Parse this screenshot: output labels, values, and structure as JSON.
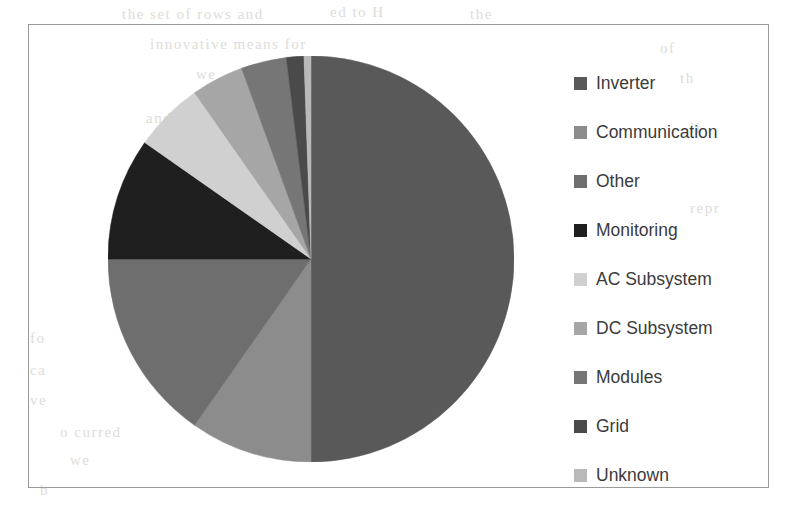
{
  "figure": {
    "frame_border_color": "#9a9a9a",
    "background_color": "#ffffff"
  },
  "legend": {
    "position": "right",
    "entries": [
      {
        "label": "Inverter",
        "color": "#595959"
      },
      {
        "label": "Communication",
        "color": "#8c8c8c"
      },
      {
        "label": "Other",
        "color": "#6e6e6e"
      },
      {
        "label": "Monitoring",
        "color": "#1f1f1f"
      },
      {
        "label": "AC Subsystem",
        "color": "#d0d0d0"
      },
      {
        "label": "DC Subsystem",
        "color": "#a6a6a6"
      },
      {
        "label": "Modules",
        "color": "#767676"
      },
      {
        "label": "Grid",
        "color": "#4a4a4a"
      },
      {
        "label": "Unknown",
        "color": "#b9b9b9"
      }
    ]
  },
  "bleed_through_text": [
    {
      "text": "the set of rows and",
      "x": 122,
      "y": 6
    },
    {
      "text": "ed to  H",
      "x": 330,
      "y": 4
    },
    {
      "text": "the",
      "x": 470,
      "y": 6
    },
    {
      "text": "innovative means for",
      "x": 150,
      "y": 36
    },
    {
      "text": "of",
      "x": 660,
      "y": 40
    },
    {
      "text": "we",
      "x": 196,
      "y": 66
    },
    {
      "text": "th",
      "x": 680,
      "y": 70
    },
    {
      "text": "and",
      "x": 146,
      "y": 110
    },
    {
      "text": "li",
      "x": 690,
      "y": 120
    },
    {
      "text": "repr",
      "x": 690,
      "y": 200
    },
    {
      "text": "ve repr",
      "x": 152,
      "y": 302
    },
    {
      "text": "fo",
      "x": 30,
      "y": 330
    },
    {
      "text": "ca",
      "x": 30,
      "y": 362
    },
    {
      "text": "ve",
      "x": 30,
      "y": 392
    },
    {
      "text": "o  curred",
      "x": 60,
      "y": 424
    },
    {
      "text": "we",
      "x": 70,
      "y": 452
    },
    {
      "text": "b",
      "x": 40,
      "y": 482
    }
  ],
  "chart_data": {
    "type": "pie",
    "title": "",
    "center": {
      "x": 310,
      "y": 258
    },
    "radius": 203,
    "start_angle_deg": 0,
    "direction": "clockwise",
    "categories": [
      "Inverter",
      "Communication",
      "Other",
      "Monitoring",
      "AC Subsystem",
      "DC Subsystem",
      "Modules",
      "Grid",
      "Unknown"
    ],
    "values": [
      50.0,
      9.7,
      15.3,
      9.7,
      5.6,
      4.2,
      3.6,
      1.4,
      0.5
    ],
    "value_unit": "percent",
    "angles_deg": [
      180.0,
      35.0,
      55.0,
      35.0,
      20.0,
      15.0,
      13.0,
      5.0,
      2.0
    ],
    "colors": [
      "#595959",
      "#8c8c8c",
      "#6e6e6e",
      "#1f1f1f",
      "#d0d0d0",
      "#a6a6a6",
      "#767676",
      "#4a4a4a",
      "#b9b9b9"
    ],
    "labels_shown": false,
    "legend_position": "right"
  }
}
